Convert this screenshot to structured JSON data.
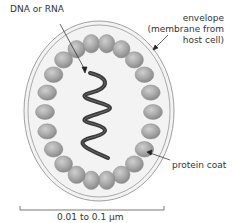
{
  "diagram": {
    "labels": {
      "nucleic_acid": "DNA or RNA",
      "envelope_line1": "envelope",
      "envelope_line2": "(membrane from",
      "envelope_line3": "host cell)",
      "protein_coat": "protein coat",
      "scale": "0.01 to 0.1 µm"
    },
    "colors": {
      "envelope_fill": "#f1f1f1",
      "envelope_stroke": "#9a9a9a",
      "bead_fill": "#a9a9a9",
      "bead_highlight": "#c8c8c8",
      "helix": "#3a3a3a",
      "text": "#333333"
    },
    "icons": {
      "bead": "protein-subunit-ellipse",
      "helix": "double-helix"
    }
  }
}
